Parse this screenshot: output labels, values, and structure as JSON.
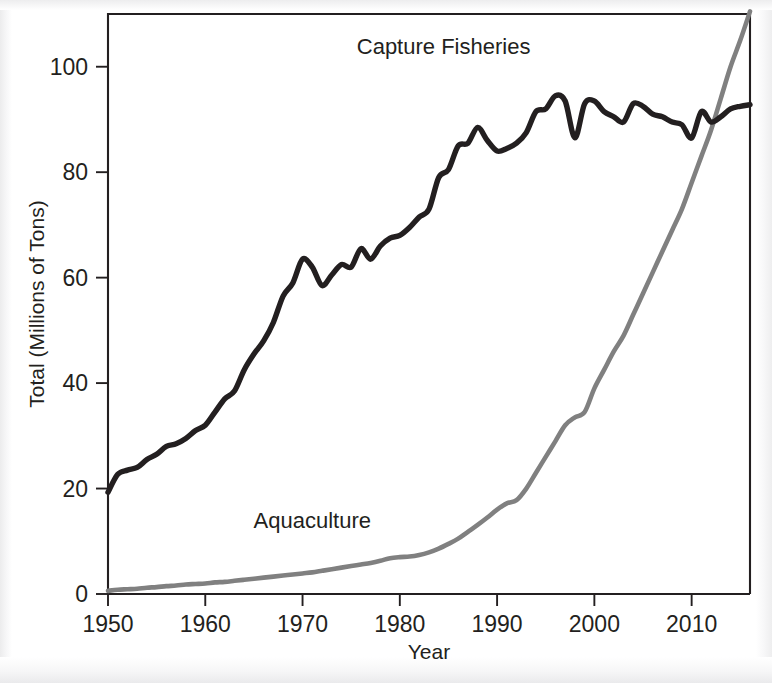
{
  "chart_data": {
    "type": "line",
    "title": "",
    "xlabel": "Year",
    "ylabel": "Total (Millions of Tons)",
    "xlim": [
      1950,
      2016
    ],
    "ylim": [
      0,
      110
    ],
    "grid": false,
    "legend_position": "inline-annotations",
    "xticks": [
      1950,
      1960,
      1970,
      1980,
      1990,
      2000,
      2010
    ],
    "xtick_labels": [
      "1950",
      "1960",
      "1970",
      "1980",
      "1990",
      "2000",
      "2010"
    ],
    "yticks": [
      0,
      20,
      40,
      60,
      80,
      100
    ],
    "ytick_labels": [
      "0",
      "20",
      "40",
      "60",
      "80",
      "100"
    ],
    "annotations": [
      {
        "text": "Capture Fisheries",
        "x": 1984.5,
        "y": 102.5,
        "color": "#231f20"
      },
      {
        "text": "Aquaculture",
        "x": 1971.0,
        "y": 12.5,
        "color": "#231f20"
      }
    ],
    "x": [
      1950,
      1951,
      1952,
      1953,
      1954,
      1955,
      1956,
      1957,
      1958,
      1959,
      1960,
      1961,
      1962,
      1963,
      1964,
      1965,
      1966,
      1967,
      1968,
      1969,
      1970,
      1971,
      1972,
      1973,
      1974,
      1975,
      1976,
      1977,
      1978,
      1979,
      1980,
      1981,
      1982,
      1983,
      1984,
      1985,
      1986,
      1987,
      1988,
      1989,
      1990,
      1991,
      1992,
      1993,
      1994,
      1995,
      1996,
      1997,
      1998,
      1999,
      2000,
      2001,
      2002,
      2003,
      2004,
      2005,
      2006,
      2007,
      2008,
      2009,
      2010,
      2011,
      2012,
      2013,
      2014,
      2015,
      2016
    ],
    "series": [
      {
        "name": "Capture Fisheries",
        "color": "#231f20",
        "values": [
          19.3,
          22.7,
          23.5,
          24.0,
          25.5,
          26.5,
          28.0,
          28.5,
          29.5,
          31.0,
          32.0,
          34.5,
          37.0,
          38.5,
          42.5,
          45.5,
          48.0,
          51.5,
          56.5,
          59.0,
          63.5,
          62.0,
          58.5,
          60.5,
          62.5,
          62.0,
          65.5,
          63.5,
          66.0,
          67.5,
          68.0,
          69.5,
          71.5,
          73.0,
          79.0,
          80.5,
          85.0,
          85.5,
          88.5,
          86.0,
          84.0,
          84.5,
          85.5,
          87.5,
          91.5,
          92.0,
          94.5,
          93.5,
          86.5,
          93.0,
          93.5,
          91.5,
          90.5,
          89.5,
          93.0,
          92.5,
          91.0,
          90.5,
          89.5,
          89.0,
          86.5,
          91.5,
          89.5,
          90.5,
          92.0,
          92.5,
          92.8
        ]
      },
      {
        "name": "Aquaculture",
        "color": "#808080",
        "values": [
          0.6,
          0.8,
          0.9,
          1.0,
          1.2,
          1.3,
          1.5,
          1.6,
          1.8,
          1.9,
          2.0,
          2.2,
          2.3,
          2.5,
          2.7,
          2.9,
          3.1,
          3.3,
          3.5,
          3.7,
          3.9,
          4.1,
          4.4,
          4.7,
          5.0,
          5.3,
          5.6,
          5.9,
          6.3,
          6.8,
          7.0,
          7.1,
          7.4,
          7.9,
          8.6,
          9.5,
          10.5,
          11.8,
          13.1,
          14.5,
          16.0,
          17.2,
          17.8,
          20.0,
          23.0,
          26.0,
          29.0,
          32.0,
          33.5,
          34.5,
          39.0,
          42.5,
          46.0,
          49.0,
          53.0,
          57.0,
          61.0,
          65.0,
          69.0,
          73.0,
          78.0,
          83.0,
          88.0,
          94.0,
          100.0,
          105.0,
          110.5
        ]
      }
    ]
  },
  "axes": {
    "x_axis_title": "Year",
    "y_axis_title": "Total (Millions of Tons)"
  }
}
